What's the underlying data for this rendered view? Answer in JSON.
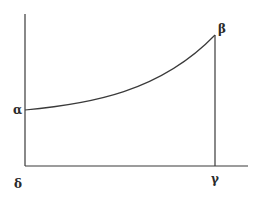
{
  "diagram": {
    "labels": {
      "a": "α",
      "b": "β",
      "c": "γ",
      "d": "δ"
    },
    "colors": {
      "line": "#3a3a3a",
      "background": "#ffffff"
    }
  }
}
